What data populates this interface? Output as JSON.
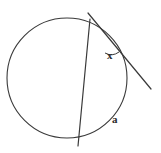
{
  "figure": {
    "kind": "geometry-diagram",
    "width": 161,
    "height": 153,
    "background_color": "#ffffff",
    "stroke_color": "#3a3a3a",
    "text_color": "#2b2b2b"
  },
  "circle": {
    "name": "circle",
    "cx": 67,
    "cy": 78,
    "r": 60,
    "stroke_width": 1.1,
    "fill": "none"
  },
  "tangent_line": {
    "name": "tangent-line",
    "x1": 88,
    "y1": 13,
    "x2": 151,
    "y2": 89,
    "stroke_width": 1.2
  },
  "chord_line": {
    "name": "chord-secant-line",
    "x1": 90,
    "y1": 19,
    "x2": 78,
    "y2": 146,
    "stroke_width": 1.2
  },
  "tangent_point": {
    "name": "tangent-point",
    "x": 113,
    "y": 38
  },
  "angle_arc": {
    "name": "angle-arc-x",
    "path": "M 105 53 A 13 13 0 0 0 119 52",
    "stroke_width": 1.0
  },
  "labels": {
    "angle_x": "x",
    "arc_a": "a"
  },
  "chart_data": {
    "type": "diagram",
    "elements": [
      "circle",
      "tangent line",
      "chord (secant) line",
      "angle arc"
    ],
    "annotations": [
      {
        "label": "x",
        "meaning": "angle between tangent and chord at point of tangency"
      },
      {
        "label": "a",
        "meaning": "intercepted arc on the circle"
      }
    ]
  }
}
